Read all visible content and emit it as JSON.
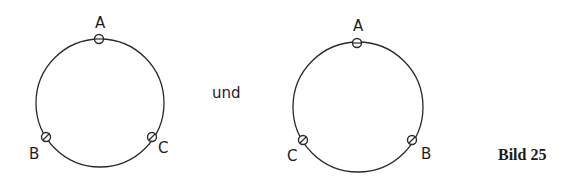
{
  "figure": {
    "connector_text": "und",
    "caption": "Bild 25",
    "stroke_color": "#2a2a2a",
    "left_ring": {
      "points": [
        {
          "label": "A",
          "position": "top"
        },
        {
          "label": "B",
          "position": "bottom-left"
        },
        {
          "label": "C",
          "position": "bottom-right"
        }
      ]
    },
    "right_ring": {
      "points": [
        {
          "label": "A",
          "position": "top"
        },
        {
          "label": "C",
          "position": "bottom-left"
        },
        {
          "label": "B",
          "position": "bottom-right"
        }
      ]
    }
  }
}
